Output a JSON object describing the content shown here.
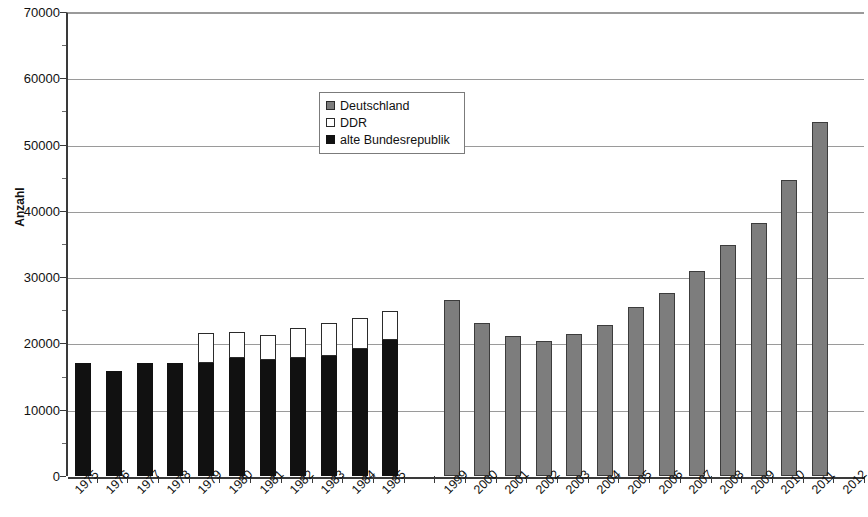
{
  "chart_data": {
    "type": "bar",
    "title": "",
    "subtitle": "",
    "xlabel": "",
    "ylabel": "Anzahl",
    "ylim": [
      0,
      70000
    ],
    "ytick_step": 10000,
    "ytick_labels": [
      "70000",
      "60000",
      "50000",
      "40000",
      "30000",
      "20000",
      "10000",
      "0"
    ],
    "ytick_values": [
      70000,
      60000,
      50000,
      40000,
      30000,
      20000,
      10000,
      0
    ],
    "grid": true,
    "stacked": true,
    "legend_position": "upper-center-left",
    "legend": [
      {
        "name": "Deutschland",
        "color": "#7d7d7d",
        "swatch": "gray"
      },
      {
        "name": "DDR",
        "color": "#ffffff",
        "swatch": "white"
      },
      {
        "name": "alte Bundesrepublik",
        "color": "#111111",
        "swatch": "black"
      }
    ],
    "categories": [
      "1975",
      "1976",
      "1977",
      "1978",
      "1979",
      "1980",
      "1981",
      "1982",
      "1983",
      "1984",
      "1985",
      "",
      "1999",
      "2000",
      "2001",
      "2002",
      "2003",
      "2004",
      "2005",
      "2006",
      "2007",
      "2008",
      "2009",
      "2010",
      "2011",
      "2012"
    ],
    "series": [
      {
        "name": "alte Bundesrepublik",
        "color": "#111111",
        "values": [
          17000,
          15800,
          17000,
          17100,
          17000,
          17800,
          17500,
          17800,
          18100,
          19200,
          20500,
          null,
          null,
          null,
          null,
          null,
          null,
          null,
          null,
          null,
          null,
          null,
          null,
          null,
          null,
          null
        ]
      },
      {
        "name": "DDR",
        "color": "#ffffff",
        "values": [
          null,
          null,
          null,
          null,
          4600,
          3900,
          3700,
          4600,
          5000,
          4600,
          4400,
          null,
          null,
          null,
          null,
          null,
          null,
          null,
          null,
          null,
          null,
          null,
          null,
          null,
          null,
          null
        ]
      },
      {
        "name": "Deutschland",
        "color": "#7d7d7d",
        "values": [
          null,
          null,
          null,
          null,
          null,
          null,
          null,
          null,
          null,
          null,
          null,
          null,
          26600,
          23100,
          21100,
          20400,
          21400,
          22800,
          25500,
          27600,
          30900,
          34900,
          38200,
          44700,
          53400,
          null
        ]
      }
    ],
    "stack_totals": [
      17000,
      15800,
      17000,
      17100,
      21600,
      21700,
      21200,
      22400,
      23100,
      23800,
      24900,
      null,
      26600,
      23100,
      21100,
      20400,
      21400,
      22800,
      25500,
      27600,
      30900,
      34900,
      38200,
      44700,
      53400,
      null
    ]
  }
}
